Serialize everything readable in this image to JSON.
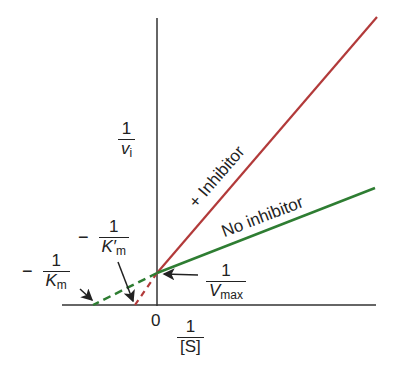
{
  "diagram": {
    "type": "Lineweaver-Burk double-reciprocal plot (competitive inhibition)",
    "colors": {
      "inhibitor_line": "#b23a3a",
      "no_inhibitor_line": "#2e7d32",
      "axis": "#222222"
    },
    "y_axis": {
      "numerator": "1",
      "denominator_var": "v",
      "denominator_sub": "i"
    },
    "x_axis": {
      "numerator": "1",
      "denominator": "[S]",
      "origin": "0"
    },
    "lines": [
      {
        "name": "inhibitor",
        "label": "+ Inhibitor"
      },
      {
        "name": "no-inhibitor",
        "label": "No inhibitor"
      }
    ],
    "annotations": {
      "vmax": {
        "numerator": "1",
        "denominator_var": "V",
        "denominator_sub": "max"
      },
      "km": {
        "sign": "−",
        "numerator": "1",
        "denominator_var": "K",
        "denominator_sub": "m"
      },
      "km_prime": {
        "sign": "−",
        "numerator": "1",
        "denominator_var": "K′",
        "denominator_sub": "m"
      }
    }
  }
}
